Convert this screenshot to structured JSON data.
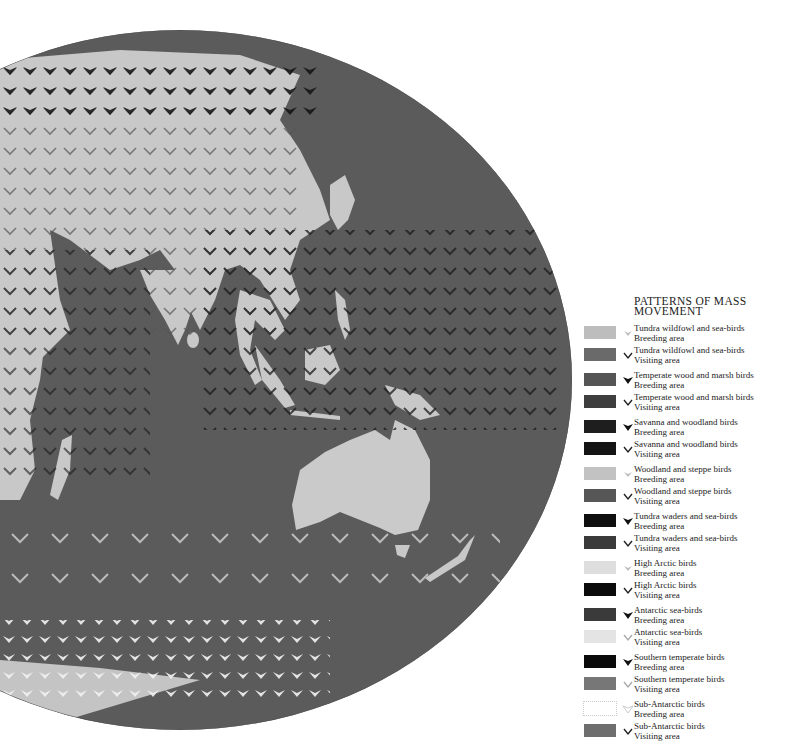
{
  "legend": {
    "title_line1": "PATTERNS OF MASS",
    "title_line2": "MOVEMENT",
    "items": [
      {
        "group": "Tundra wildfowl and sea-birds",
        "area": "Breeding area",
        "swatch": "#bdbdbd",
        "symbol": "breeding-arrow-light"
      },
      {
        "group": "Tundra wildfowl and sea-birds",
        "area": "Visiting area",
        "swatch": "#6a6a6a",
        "symbol": "visiting-chevron"
      },
      {
        "group": "Temperate wood and marsh birds",
        "area": "Breeding area",
        "swatch": "#555555",
        "symbol": "breeding-arrow"
      },
      {
        "group": "Temperate wood and marsh birds",
        "area": "Visiting area",
        "swatch": "#3e3e3e",
        "symbol": "visiting-chevron"
      },
      {
        "group": "Savanna and woodland birds",
        "area": "Breeding area",
        "swatch": "#1e1e1e",
        "symbol": "breeding-arrow"
      },
      {
        "group": "Savanna and woodland birds",
        "area": "Visiting area",
        "swatch": "#141414",
        "symbol": "visiting-chevron"
      },
      {
        "group": "Woodland and steppe birds",
        "area": "Breeding area",
        "swatch": "#c2c2c2",
        "symbol": "breeding-arrow-light"
      },
      {
        "group": "Woodland and steppe birds",
        "area": "Visiting area",
        "swatch": "#575757",
        "symbol": "visiting-chevron"
      },
      {
        "group": "Tundra waders and sea-birds",
        "area": "Breeding area",
        "swatch": "#0f0f0f",
        "symbol": "breeding-arrow"
      },
      {
        "group": "Tundra waders and sea-birds",
        "area": "Visiting area",
        "swatch": "#3a3a3a",
        "symbol": "visiting-chevron"
      },
      {
        "group": "High Arctic birds",
        "area": "Breeding area",
        "swatch": "#dedede",
        "symbol": "breeding-arrow-light"
      },
      {
        "group": "High Arctic birds",
        "area": "Visiting area",
        "swatch": "#0b0b0b",
        "symbol": "visiting-chevron"
      },
      {
        "group": "Antarctic sea-birds",
        "area": "Breeding area",
        "swatch": "#3a3a3a",
        "symbol": "breeding-arrow"
      },
      {
        "group": "Antarctic sea-birds",
        "area": "Visiting area",
        "swatch": "#e4e4e4",
        "symbol": "visiting-chevron-light"
      },
      {
        "group": "Southern temperate birds",
        "area": "Breeding area",
        "swatch": "#0a0a0a",
        "symbol": "breeding-arrow"
      },
      {
        "group": "Southern temperate birds",
        "area": "Visiting area",
        "swatch": "#777777",
        "symbol": "visiting-chevron-light"
      },
      {
        "group": "Sub-Antarctic birds",
        "area": "Breeding area",
        "swatch": "#ffffff",
        "symbol": "breeding-arrow-outline"
      },
      {
        "group": "Sub-Antarctic birds",
        "area": "Visiting area",
        "swatch": "#6e6e6e",
        "symbol": "visiting-chevron"
      }
    ]
  },
  "map": {
    "ocean_color": "#5a5a5a",
    "land_color": "#c9c9c9",
    "projection": "elliptical world map (Asia, Indian Ocean, Australia, Southern Ocean)"
  }
}
